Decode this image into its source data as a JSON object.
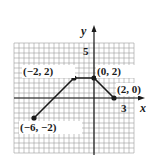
{
  "chart_data": {
    "type": "line",
    "title": "",
    "xlabel": "x",
    "ylabel": "y",
    "tick_labels": {
      "x": [
        "3"
      ],
      "y": [
        "5"
      ]
    },
    "grid": true,
    "grid_step": 0.5,
    "xlim": [
      -8,
      4
    ],
    "ylim": [
      -5.5,
      5.5
    ],
    "points": [
      {
        "x": -6,
        "y": -2,
        "label": "(−6, −2)"
      },
      {
        "x": -2,
        "y": 2,
        "label": "(−2, 2)"
      },
      {
        "x": 0,
        "y": 2,
        "label": "(0, 2)"
      },
      {
        "x": 2,
        "y": 0,
        "label": "(2, 0)"
      }
    ],
    "colors": {
      "line": "#1a1a1a",
      "grid": "#9a9a9a",
      "background": "#ffffff"
    }
  }
}
